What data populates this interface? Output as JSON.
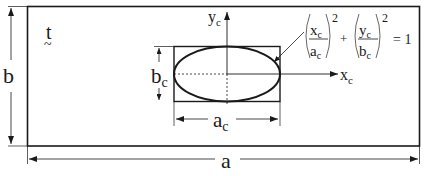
{
  "diagram": {
    "labels": {
      "plate_width": "a",
      "plate_height": "b",
      "thickness": "t",
      "thickness_tilde": "~",
      "crack_width": "a",
      "crack_width_sub": "c",
      "crack_height": "b",
      "crack_height_sub": "c",
      "x_axis": "x",
      "x_axis_sub": "c",
      "y_axis": "y",
      "y_axis_sub": "c"
    },
    "equation": {
      "term1_num": "x",
      "term1_num_sub": "c",
      "term1_den": "a",
      "term1_den_sub": "c",
      "term2_num": "y",
      "term2_num_sub": "c",
      "term2_den": "b",
      "term2_den_sub": "c",
      "exponent": "2",
      "plus": "+",
      "rhs": "= 1"
    },
    "colors": {
      "line": "#1a1a1a",
      "background": "#ffffff"
    }
  }
}
